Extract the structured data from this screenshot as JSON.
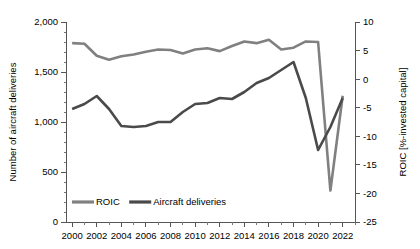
{
  "chart_data": {
    "type": "line",
    "title": "",
    "xlabel": "",
    "grid": false,
    "legend_position": "inside-bottom-left",
    "x": [
      2000,
      2001,
      2002,
      2003,
      2004,
      2005,
      2006,
      2007,
      2008,
      2009,
      2010,
      2011,
      2012,
      2013,
      2014,
      2015,
      2016,
      2017,
      2018,
      2019,
      2020,
      2021,
      2022
    ],
    "xlim": [
      1999.5,
      2023.0
    ],
    "x_tick_labels": [
      "2000",
      "2002",
      "2004",
      "2006",
      "2008",
      "2010",
      "2012",
      "2014",
      "2016",
      "2018",
      "2020",
      "2022"
    ],
    "x_ticks": [
      2000,
      2002,
      2004,
      2006,
      2008,
      2010,
      2012,
      2014,
      2016,
      2018,
      2020,
      2022
    ],
    "left_axis": {
      "label": "Number of aircraft deliveries",
      "ylim": [
        0,
        2000
      ],
      "ticks": [
        0,
        500,
        1000,
        1500,
        2000
      ],
      "tick_labels": [
        "0",
        "500",
        "1,000",
        "1,500",
        "2,000"
      ],
      "minor_step": 100
    },
    "right_axis": {
      "label": "ROIC [%-invested capital]",
      "ylim": [
        -25,
        10
      ],
      "ticks": [
        10,
        5,
        0,
        -5,
        -10,
        -15,
        -20,
        -25
      ],
      "tick_labels": [
        "10",
        "5",
        "0",
        "-5",
        "-10",
        "-15",
        "-20",
        "-25"
      ]
    },
    "series": [
      {
        "name": "ROIC",
        "axis": "right",
        "color": "#808080",
        "unit": "%",
        "values": [
          6.3,
          6.2,
          4.1,
          3.4,
          4.0,
          4.3,
          4.8,
          5.2,
          5.1,
          4.5,
          5.2,
          5.4,
          4.9,
          5.8,
          6.6,
          6.3,
          6.9,
          5.2,
          5.5,
          6.6,
          6.5,
          -19.5,
          -2.9
        ]
      },
      {
        "name": "Aircraft deliveries",
        "axis": "left",
        "color": "#4a4a4a",
        "unit": "deliveries",
        "values": [
          1130,
          1180,
          1260,
          1130,
          960,
          950,
          960,
          1000,
          1000,
          1100,
          1180,
          1190,
          1240,
          1230,
          1300,
          1390,
          1440,
          1520,
          1600,
          1240,
          720,
          950,
          1240
        ]
      }
    ],
    "legend": [
      {
        "label": "ROIC",
        "color": "#808080"
      },
      {
        "label": "Aircraft deliveries",
        "color": "#4a4a4a"
      }
    ]
  }
}
